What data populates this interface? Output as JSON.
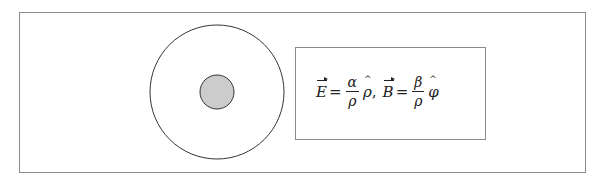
{
  "diagram": {
    "outer_circle": {
      "cx": 217,
      "cy": 92,
      "r": 67,
      "stroke": "#333333",
      "fill": "#ffffff"
    },
    "inner_circle": {
      "cx": 217,
      "cy": 92,
      "r": 17,
      "stroke": "#333333",
      "fill": "#cccccc"
    },
    "formula": {
      "E_symbol": "E",
      "equals1": "=",
      "E_num": "α",
      "E_den": "ρ",
      "E_unit": "ρ",
      "comma": ",",
      "B_symbol": "B",
      "equals2": "=",
      "B_num": "β",
      "B_den": "ρ",
      "B_unit": "φ"
    }
  }
}
